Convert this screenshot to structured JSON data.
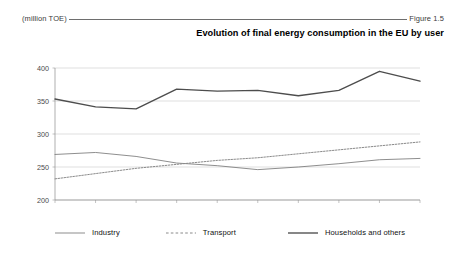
{
  "header": {
    "unit_label": "(million TOE)",
    "figure_label": "Figure 1.5"
  },
  "title": "Evolution of final energy consumption in the EU by user",
  "legend": {
    "items": [
      {
        "label": "Industry",
        "style": "solid-thin",
        "color": "#7a7a7a"
      },
      {
        "label": "Transport",
        "style": "dashed",
        "color": "#8a8a8a"
      },
      {
        "label": "Households and others",
        "style": "solid-thick",
        "color": "#4d4d4d"
      }
    ]
  },
  "chart_data": {
    "type": "line",
    "title": "Evolution of final energy consumption in the EU by user",
    "xlabel": "",
    "ylabel": "(million TOE)",
    "unit": "million TOE",
    "categories": [
      "1988",
      "1989",
      "1990",
      "1991",
      "1992",
      "1993",
      "1994",
      "1995",
      "1996",
      "1997"
    ],
    "x": [
      1988,
      1989,
      1990,
      1991,
      1992,
      1993,
      1994,
      1995,
      1996,
      1997
    ],
    "ylim": [
      200,
      400
    ],
    "yticks": [
      200,
      250,
      300,
      350,
      400
    ],
    "ytick_labels": [
      "200",
      "250",
      "300",
      "350",
      "400"
    ],
    "grid": "horizontal",
    "legend_position": "bottom",
    "series": [
      {
        "name": "Industry",
        "color": "#7a7a7a",
        "style": "solid-thin",
        "values": [
          269,
          272,
          266,
          256,
          252,
          246,
          250,
          255,
          261,
          263
        ]
      },
      {
        "name": "Transport",
        "color": "#8a8a8a",
        "style": "dashed",
        "values": [
          232,
          240,
          248,
          254,
          260,
          264,
          270,
          276,
          282,
          288
        ]
      },
      {
        "name": "Households and others",
        "color": "#4d4d4d",
        "style": "solid-thick",
        "values": [
          353,
          341,
          338,
          368,
          365,
          366,
          358,
          366,
          395,
          380
        ]
      }
    ]
  }
}
